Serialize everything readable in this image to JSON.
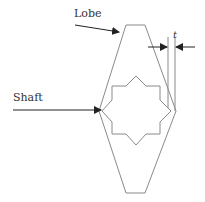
{
  "diagram": {
    "labels": {
      "lobe": "Lobe",
      "shaft": "Shaft",
      "thickness": "t"
    },
    "colors": {
      "outline": "#8a8a8a",
      "arrow": "#222222",
      "text": "#333333",
      "background": "#ffffff"
    },
    "shapes": {
      "lobe_outline": "126,25 145,25 176,111 145,193 126,193 99,111",
      "shaft_star": "136,76 146,86 160,86 160,100 171,111 160,122 160,134 146,134 136,145 126,134 112,134 112,122 102,111 112,100 112,86 126,86"
    }
  }
}
